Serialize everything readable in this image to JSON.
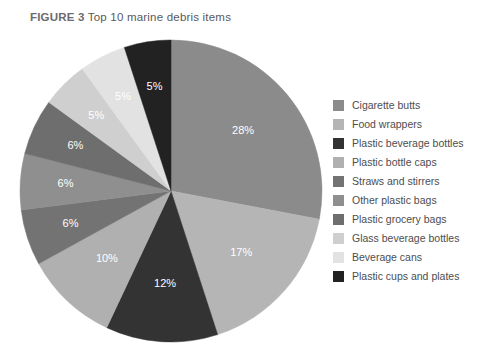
{
  "figure": {
    "label": "FIGURE 3",
    "title": "Top 10 marine debris items",
    "full_title": "FIGURE 3 Top 10 marine debris items"
  },
  "chart_data": {
    "type": "pie",
    "title": "Top 10 marine debris items",
    "xlabel": "",
    "ylabel": "",
    "grid": false,
    "legend_position": "right",
    "start_angle_deg": 0,
    "direction": "clockwise",
    "units": "percent",
    "categories": [
      "Cigarette butts",
      "Food wrappers",
      "Plastic beverage bottles",
      "Plastic bottle caps",
      "Straws and stirrers",
      "Other plastic bags",
      "Plastic grocery bags",
      "Glass beverage bottles",
      "Beverage cans",
      "Plastic cups and plates"
    ],
    "values": [
      28,
      17,
      12,
      10,
      6,
      6,
      6,
      5,
      5,
      5
    ],
    "value_labels": [
      "28%",
      "17%",
      "12%",
      "10%",
      "6%",
      "6%",
      "6%",
      "5%",
      "5%",
      "5%"
    ],
    "colors": [
      "#8b8b8b",
      "#b5b5b5",
      "#333333",
      "#b0b0b0",
      "#737373",
      "#8f8f8f",
      "#6e6e6e",
      "#cfcfcf",
      "#e2e2e2",
      "#222222"
    ],
    "slices": [
      {
        "label": "Cigarette butts",
        "value": 28,
        "value_label": "28%",
        "color": "#8b8b8b"
      },
      {
        "label": "Food wrappers",
        "value": 17,
        "value_label": "17%",
        "color": "#b5b5b5"
      },
      {
        "label": "Plastic beverage bottles",
        "value": 12,
        "value_label": "12%",
        "color": "#333333"
      },
      {
        "label": "Plastic bottle caps",
        "value": 10,
        "value_label": "10%",
        "color": "#b0b0b0"
      },
      {
        "label": "Straws and stirrers",
        "value": 6,
        "value_label": "6%",
        "color": "#737373"
      },
      {
        "label": "Other plastic bags",
        "value": 6,
        "value_label": "6%",
        "color": "#8f8f8f"
      },
      {
        "label": "Plastic grocery bags",
        "value": 6,
        "value_label": "6%",
        "color": "#6e6e6e"
      },
      {
        "label": "Glass beverage bottles",
        "value": 5,
        "value_label": "5%",
        "color": "#cfcfcf"
      },
      {
        "label": "Beverage cans",
        "value": 5,
        "value_label": "5%",
        "color": "#e2e2e2"
      },
      {
        "label": "Plastic cups and plates",
        "value": 5,
        "value_label": "5%",
        "color": "#222222"
      }
    ]
  },
  "legend": {
    "items": [
      {
        "label": "Cigarette butts",
        "color": "#8b8b8b"
      },
      {
        "label": "Food wrappers",
        "color": "#b5b5b5"
      },
      {
        "label": "Plastic beverage bottles",
        "color": "#333333"
      },
      {
        "label": "Plastic bottle caps",
        "color": "#b0b0b0"
      },
      {
        "label": "Straws and stirrers",
        "color": "#737373"
      },
      {
        "label": "Other plastic bags",
        "color": "#8f8f8f"
      },
      {
        "label": "Plastic grocery bags",
        "color": "#6e6e6e"
      },
      {
        "label": "Glass beverage bottles",
        "color": "#cfcfcf"
      },
      {
        "label": "Beverage cans",
        "color": "#e2e2e2"
      },
      {
        "label": "Plastic cups and plates",
        "color": "#222222"
      }
    ]
  }
}
